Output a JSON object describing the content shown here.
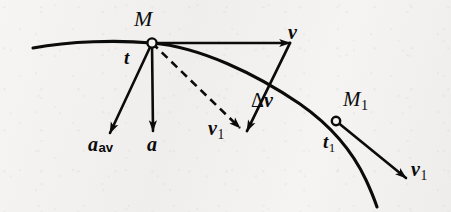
{
  "figure": {
    "kind": "physics-vector-diagram",
    "background_color": "#f4f3f1",
    "ink_color": "#0b0b0b",
    "width": 451,
    "height": 212
  },
  "labels": {
    "point_M": "M",
    "time_t": "t",
    "velocity_v": "v",
    "velocity_v1_translated": "v",
    "velocity_v1_translated_sub": "1",
    "delta_v_symbol": "Δ",
    "delta_v_name": "v",
    "accel_avg_name": "a",
    "accel_avg_sub": "av",
    "accel_name": "a",
    "point_M1": "M",
    "point_M1_sub": "1",
    "time_t1": "t",
    "time_t1_sub": "1",
    "velocity_v1_tangent": "v",
    "velocity_v1_tangent_sub": "1"
  },
  "geometry": {
    "marker_M": {
      "x": 152,
      "y": 43,
      "r": 4.6
    },
    "marker_M1": {
      "x": 336,
      "y": 121,
      "r": 4.2
    },
    "trajectory_path": "M 33,48 C 70,41 118,40 152,43 C 200,47 256,74 300,104 C 330,125 352,150 366,180 C 372,193 375,201 377,207",
    "vector_v": {
      "x1": 152,
      "y1": 43,
      "x2": 290,
      "y2": 43
    },
    "vector_v1_dashed": {
      "x1": 152,
      "y1": 43,
      "x2": 240,
      "y2": 128
    },
    "vector_delta_v": {
      "x1": 290,
      "y1": 43,
      "x2": 247,
      "y2": 131
    },
    "vector_a_avg": {
      "x1": 152,
      "y1": 43,
      "x2": 110,
      "y2": 133
    },
    "vector_a": {
      "x1": 152,
      "y1": 43,
      "x2": 153,
      "y2": 131
    },
    "vector_v1_tangent": {
      "x1": 336,
      "y1": 121,
      "x2": 406,
      "y2": 178
    }
  },
  "label_positions": {
    "point_M": {
      "x": 134,
      "y": 8,
      "size": 22
    },
    "time_t": {
      "x": 124,
      "y": 48,
      "size": 19
    },
    "velocity_v": {
      "x": 288,
      "y": 22,
      "size": 20
    },
    "velocity_v1_translated": {
      "x": 208,
      "y": 118,
      "size": 20
    },
    "delta_v": {
      "x": 251,
      "y": 90,
      "size": 20
    },
    "accel_avg": {
      "x": 88,
      "y": 134,
      "size": 20
    },
    "accel": {
      "x": 147,
      "y": 134,
      "size": 20
    },
    "point_M1": {
      "x": 343,
      "y": 89,
      "size": 21
    },
    "time_t1": {
      "x": 323,
      "y": 132,
      "size": 19
    },
    "velocity_v1_tangent": {
      "x": 411,
      "y": 159,
      "size": 20
    }
  }
}
